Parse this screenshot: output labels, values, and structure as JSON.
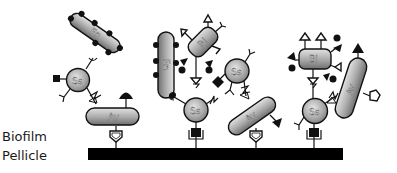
{
  "diagram": {
    "type": "biofilm-coaggregation-schematic",
    "labels": {
      "layer_top": "Biofilm",
      "layer_bottom": "Pellicle"
    },
    "cells": [
      {
        "id": "fn1",
        "label": "Fn",
        "shape": "rod",
        "cx": 95,
        "cy": 33,
        "angle": 35
      },
      {
        "id": "ss1",
        "label": "Ss",
        "shape": "coccus",
        "cx": 78,
        "cy": 80
      },
      {
        "id": "av1",
        "label": "Av",
        "shape": "rod",
        "cx": 116,
        "cy": 117,
        "angle": 0
      },
      {
        "id": "fn2",
        "label": "Fn",
        "shape": "rod",
        "cx": 166,
        "cy": 65,
        "angle": 90
      },
      {
        "id": "bl1",
        "label": "Bl",
        "shape": "rod",
        "cx": 203,
        "cy": 42,
        "angle": -45
      },
      {
        "id": "ss2",
        "label": "Ss",
        "shape": "coccus",
        "cx": 196,
        "cy": 110
      },
      {
        "id": "ss3",
        "label": "Ss",
        "shape": "coccus",
        "cx": 237,
        "cy": 71
      },
      {
        "id": "av2",
        "label": "Av",
        "shape": "rod",
        "cx": 252,
        "cy": 116,
        "angle": -35
      },
      {
        "id": "bl2",
        "label": "Bl",
        "shape": "rod",
        "cx": 315,
        "cy": 58,
        "angle": 0
      },
      {
        "id": "ss4",
        "label": "Ss",
        "shape": "coccus",
        "cx": 315,
        "cy": 111
      },
      {
        "id": "av3",
        "label": "Av",
        "shape": "rod",
        "cx": 351,
        "cy": 88,
        "angle": -70
      }
    ],
    "colors": {
      "cell_fill_light": "#d6d6d6",
      "cell_fill_dark": "#7a7a7a",
      "outline": "#111111",
      "pellicle": "#000000",
      "background": "#ffffff"
    }
  }
}
